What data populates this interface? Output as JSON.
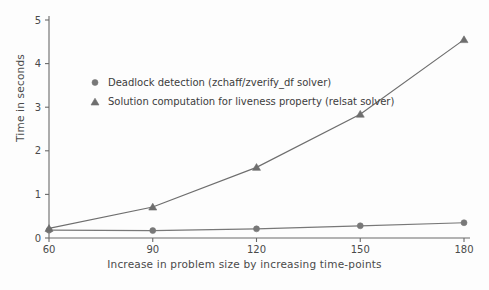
{
  "chart_data": {
    "type": "line",
    "title": "",
    "xlabel": "Increase in problem size by increasing time-points",
    "ylabel": "Time in seconds",
    "x": [
      60,
      90,
      120,
      150,
      180
    ],
    "xtick_labels": [
      "60",
      "90",
      "120",
      "150",
      "180"
    ],
    "ytick_labels": [
      "0",
      "1",
      "2",
      "3",
      "4",
      "5"
    ],
    "xlim": [
      60,
      180
    ],
    "ylim": [
      0,
      5
    ],
    "grid": false,
    "legend_position": "upper-left-inside",
    "series": [
      {
        "name": "Deadlock detection (zchaff/zverify_df solver)",
        "marker": "circle",
        "color": "#787878",
        "values": [
          0.18,
          0.17,
          0.21,
          0.28,
          0.35
        ]
      },
      {
        "name": "Solution computation for liveness property (relsat solver)",
        "marker": "triangle",
        "color": "#6e6e6e",
        "values": [
          0.22,
          0.71,
          1.62,
          2.84,
          4.55
        ]
      }
    ]
  },
  "axes": {
    "y_axis_name": "Time in seconds",
    "x_axis_name": "Increase in problem size by increasing time-points"
  },
  "colors": {
    "background": "#fdfdfd",
    "axis": "#6a6a6a",
    "series_1": "#787878",
    "series_2": "#6e6e6e",
    "text": "#3c3c3c"
  }
}
